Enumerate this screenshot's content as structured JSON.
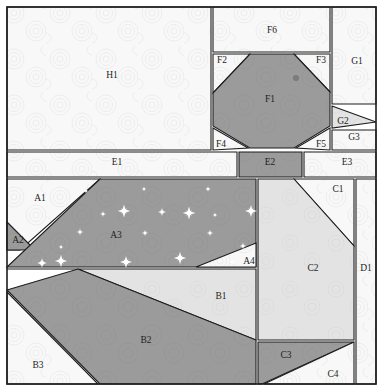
{
  "document": {
    "title": "Paper-Piecing Pattern - Bird Block",
    "width": 383,
    "height": 391
  },
  "palette": {
    "background": "#ffffff",
    "light_texture": "#f7f7f7",
    "light_gray": "#e2e2e2",
    "mid_gray": "#c9c9c9",
    "dark_gray": "#9b9b9b",
    "outline": "#1d1d1d",
    "label_text": "#1d1d1d",
    "star_motif": "#ffffff",
    "eye_dot": "#7c7c7c"
  },
  "sections": [
    {
      "id": "H1",
      "label": "H1",
      "group": "H",
      "fill": "light_texture",
      "label_x": 112,
      "label_y": 76,
      "points": "7,7 211,7 211,150 7,150"
    },
    {
      "id": "F6",
      "label": "F6",
      "group": "F",
      "fill": "light_texture",
      "label_x": 272,
      "label_y": 31,
      "points": "213,7 330,7 330,52 213,52"
    },
    {
      "id": "G1",
      "label": "G1",
      "group": "G",
      "fill": "light_texture",
      "label_x": 357,
      "label_y": 62,
      "points": "332,7 376,7 376,104 332,104"
    },
    {
      "id": "F2",
      "label": "F2",
      "group": "F",
      "fill": "light_texture",
      "label_x": 222,
      "label_y": 61,
      "points": "213,54 250,54 213,93"
    },
    {
      "id": "F3",
      "label": "F3",
      "group": "F",
      "fill": "light_texture",
      "label_x": 321,
      "label_y": 61,
      "points": "294,54 330,54 330,92"
    },
    {
      "id": "F1",
      "label": "F1",
      "group": "F",
      "fill": "dark_gray",
      "label_x": 270,
      "label_y": 100,
      "points": "250,54 294,54 330,92 330,126 294,148 250,148 213,126 213,93"
    },
    {
      "id": "G2",
      "label": "G2",
      "group": "G",
      "fill": "light_gray",
      "label_x": 343,
      "label_y": 122,
      "points": "332,106 376,122 332,128"
    },
    {
      "id": "G3",
      "label": "G3",
      "group": "G",
      "fill": "light_texture",
      "label_x": 354,
      "label_y": 138,
      "points": "332,130 376,130 376,150 332,150"
    },
    {
      "id": "F4",
      "label": "F4",
      "group": "F",
      "fill": "light_texture",
      "label_x": 221,
      "label_y": 145,
      "points": "213,128 248,148 213,150"
    },
    {
      "id": "F5",
      "label": "F5",
      "group": "F",
      "fill": "light_texture",
      "label_x": 321,
      "label_y": 145,
      "points": "330,128 330,150 296,148"
    },
    {
      "id": "E1",
      "label": "E1",
      "group": "E",
      "fill": "light_texture",
      "label_x": 117,
      "label_y": 163,
      "points": "7,152 237,152 237,177 7,177"
    },
    {
      "id": "E2",
      "label": "E2",
      "group": "E",
      "fill": "dark_gray",
      "label_x": 270,
      "label_y": 163,
      "points": "239,152 302,152 302,177 239,177"
    },
    {
      "id": "E3",
      "label": "E3",
      "group": "E",
      "fill": "light_texture",
      "label_x": 347,
      "label_y": 163,
      "points": "304,152 376,152 376,177 304,177"
    },
    {
      "id": "A1",
      "label": "A1",
      "group": "A",
      "fill": "light_texture",
      "label_x": 40,
      "label_y": 199,
      "points": "7,179 100,179 20,250 7,250"
    },
    {
      "id": "A2",
      "label": "A2",
      "group": "A",
      "fill": "dark_gray",
      "label_x": 18,
      "label_y": 241,
      "points": "7,222 35,250 7,250"
    },
    {
      "id": "A3",
      "label": "A3",
      "group": "A",
      "fill": "dark_gray",
      "label_x": 116,
      "label_y": 236,
      "points": "100,179 256,179 256,267 7,267"
    },
    {
      "id": "A4",
      "label": "A4",
      "group": "A",
      "fill": "light_texture",
      "label_x": 249,
      "label_y": 262,
      "points": "256,243 256,267 196,267"
    },
    {
      "id": "B1",
      "label": "B1",
      "group": "B",
      "fill": "light_gray",
      "label_x": 221,
      "label_y": 297,
      "points": "7,269 256,269 256,340 78,269"
    },
    {
      "id": "B2",
      "label": "B2",
      "group": "B",
      "fill": "dark_gray",
      "label_x": 146,
      "label_y": 341,
      "points": "78,269 256,340 256,384 100,384 7,290"
    },
    {
      "id": "B3",
      "label": "B3",
      "group": "B",
      "fill": "light_texture",
      "label_x": 38,
      "label_y": 366,
      "points": "7,292 98,384 7,384"
    },
    {
      "id": "C1",
      "label": "C1",
      "group": "C",
      "fill": "light_texture",
      "label_x": 338,
      "label_y": 190,
      "points": "294,179 354,179 354,246"
    },
    {
      "id": "C2",
      "label": "C2",
      "group": "C",
      "fill": "light_gray",
      "label_x": 313,
      "label_y": 269,
      "points": "258,179 294,179 354,246 354,340 258,340"
    },
    {
      "id": "C3",
      "label": "C3",
      "group": "C",
      "fill": "dark_gray",
      "label_x": 286,
      "label_y": 356,
      "points": "258,342 354,342 262,384 258,384"
    },
    {
      "id": "C4",
      "label": "C4",
      "group": "C",
      "fill": "light_texture",
      "label_x": 333,
      "label_y": 375,
      "points": "354,342 354,384 264,384"
    },
    {
      "id": "D1",
      "label": "D1",
      "group": "D",
      "fill": "light_texture",
      "label_x": 366,
      "label_y": 269,
      "points": "356,179 376,179 376,384 356,384"
    }
  ],
  "motifs": {
    "eye": {
      "cx": 296,
      "cy": 78,
      "r": 3.1
    },
    "stars": [
      {
        "cx": 42,
        "cy": 263,
        "r": 4.8
      },
      {
        "cx": 61,
        "cy": 247,
        "r": 2.6
      },
      {
        "cx": 80,
        "cy": 232,
        "r": 3.4
      },
      {
        "cx": 61,
        "cy": 261,
        "r": 6.2
      },
      {
        "cx": 103,
        "cy": 214,
        "r": 3.0
      },
      {
        "cx": 124,
        "cy": 211,
        "r": 6.4
      },
      {
        "cx": 145,
        "cy": 233,
        "r": 3.2
      },
      {
        "cx": 126,
        "cy": 262,
        "r": 6.0
      },
      {
        "cx": 144,
        "cy": 189,
        "r": 2.6
      },
      {
        "cx": 162,
        "cy": 212,
        "r": 4.0
      },
      {
        "cx": 180,
        "cy": 258,
        "r": 6.2
      },
      {
        "cx": 189,
        "cy": 213,
        "r": 6.4
      },
      {
        "cx": 208,
        "cy": 189,
        "r": 2.8
      },
      {
        "cx": 210,
        "cy": 233,
        "r": 3.2
      },
      {
        "cx": 215,
        "cy": 215,
        "r": 2.6
      },
      {
        "cx": 251,
        "cy": 211,
        "r": 6.0
      },
      {
        "cx": 243,
        "cy": 246,
        "r": 3.4
      },
      {
        "cx": 232,
        "cy": 262,
        "r": 2.8
      },
      {
        "cx": 86,
        "cy": 191,
        "r": 2.6
      }
    ]
  }
}
